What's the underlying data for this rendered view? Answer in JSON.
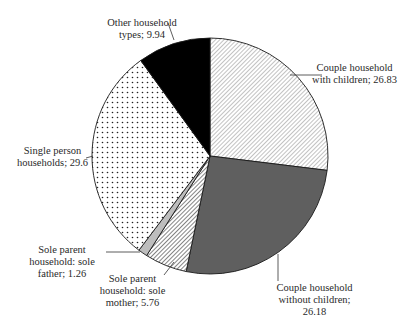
{
  "chart_data": {
    "type": "pie",
    "title": "",
    "start_angle_deg": 0,
    "direction": "clockwise",
    "slices": [
      {
        "label": "Couple household with children",
        "value": 26.83,
        "display": "Couple household\nwith children; 26.83",
        "pattern": "diagonal-hatch-light",
        "fill": "#ffffff",
        "ink": "#555555"
      },
      {
        "label": "Couple household without children",
        "value": 26.18,
        "display": "Couple household\nwithout children;\n26.18",
        "pattern": "solid",
        "fill": "#5f5f5f",
        "ink": "#5f5f5f"
      },
      {
        "label": "Sole parent household: sole mother",
        "value": 5.76,
        "display": "Sole parent\nhousehold: sole\nmother; 5.76",
        "pattern": "diagonal-hatch-dense",
        "fill": "#ffffff",
        "ink": "#333333"
      },
      {
        "label": "Sole parent household: sole father",
        "value": 1.26,
        "display": "Sole parent\nhousehold: sole\nfather; 1.26",
        "pattern": "solid",
        "fill": "#bdbdbd",
        "ink": "#bdbdbd"
      },
      {
        "label": "Single person households",
        "value": 29.6,
        "display": "Single person\nhouseholds; 29.6",
        "pattern": "dots",
        "fill": "#ffffff",
        "ink": "#222222"
      },
      {
        "label": "Other household types",
        "value": 9.94,
        "display": "Other household\ntypes; 9.94",
        "pattern": "solid",
        "fill": "#000000",
        "ink": "#000000"
      }
    ],
    "categories": [
      "Couple household with children",
      "Couple household without children",
      "Sole parent household: sole mother",
      "Sole parent household: sole father",
      "Single person households",
      "Other household types"
    ],
    "values": [
      26.83,
      26.18,
      5.76,
      1.26,
      29.6,
      9.94
    ],
    "legend": "none (inline labels with leader lines)"
  },
  "layout": {
    "cx": 210,
    "cy": 156,
    "r": 118,
    "labels": [
      {
        "x": 292,
        "y": 62,
        "w": 125,
        "lx1": 322,
        "ly1": 75,
        "lx2": 290,
        "ly2": 75
      },
      {
        "x": 262,
        "y": 282,
        "w": 105,
        "lx1": 278,
        "ly1": 281,
        "lx2": 278,
        "ly2": 254
      },
      {
        "x": 95,
        "y": 273,
        "w": 75,
        "lx1": 164,
        "ly1": 275,
        "lx2": 174,
        "ly2": 262
      },
      {
        "x": 22,
        "y": 244,
        "w": 80,
        "lx1": 106,
        "ly1": 252,
        "lx2": 140,
        "ly2": 252
      },
      {
        "x": 10,
        "y": 145,
        "w": 85,
        "lx1": 86,
        "ly1": 158,
        "lx2": 93,
        "ly2": 156
      },
      {
        "x": 82,
        "y": 17,
        "w": 120,
        "lx1": 168,
        "ly1": 23,
        "lx2": 174,
        "ly2": 40
      }
    ]
  }
}
